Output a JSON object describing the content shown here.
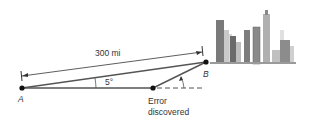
{
  "diagram": {
    "distance_label": "300 mi",
    "angle_label": "5°",
    "point_a_label": "A",
    "point_b_label": "B",
    "error_label_line1": "Error",
    "error_label_line2": "discovered",
    "colors": {
      "line": "#555555",
      "point": "#111111",
      "building_dark": "#6f6f6f",
      "building_mid": "#9a9a9a",
      "building_light": "#cfcfcf"
    }
  }
}
